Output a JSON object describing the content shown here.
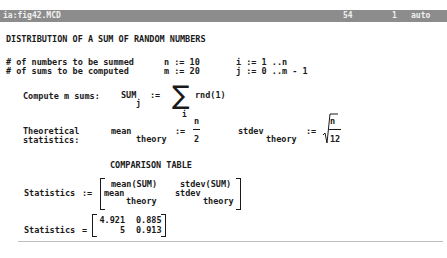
{
  "titlebar": {
    "filename": "ia:fig42.MCD",
    "line": "54",
    "column": "1",
    "mode": "auto",
    "bg_color": "#8c8c8c"
  },
  "worksheet": {
    "heading": "DISTRIBUTION OF A SUM OF RANDOM NUMBERS",
    "defs": [
      {
        "label": "# of numbers to be summed",
        "assign": "n := 10",
        "range": "i := 1 ..n"
      },
      {
        "label": "# of sums to be computed",
        "assign": "m := 20",
        "range": "j := 0 ..m - 1"
      }
    ],
    "compute": {
      "label": "Compute m sums:",
      "lhs": "SUM",
      "lhs_sub": "j",
      "op": ":=",
      "sigma": "∑",
      "sigma_sub": "i",
      "rhs": "rnd(1)"
    },
    "theory": {
      "label_line1": "Theoretical",
      "label_line2": "statistics:",
      "mean_name": "mean",
      "mean_sub": "theory",
      "mean_op": ":=",
      "mean_num": "n",
      "mean_den": "2",
      "stdev_name": "stdev",
      "stdev_sub": "theory",
      "stdev_op": ":=",
      "stdev_num": "n",
      "stdev_den": "12"
    },
    "comparison_title": "COMPARISON TABLE",
    "stat_def": {
      "lhs": "Statistics",
      "op": ":=",
      "r1c1": "mean(SUM)",
      "r1c2": "stdev(SUM)",
      "r2c1": "mean",
      "r2c1_sub": "theory",
      "r2c2": "stdev",
      "r2c2_sub": "theory"
    },
    "stat_result": {
      "lhs": "Statistics",
      "op": "=",
      "r1c1": "4.921",
      "r1c2": "0.885",
      "r2c1": "5",
      "r2c2": "0.913"
    }
  }
}
